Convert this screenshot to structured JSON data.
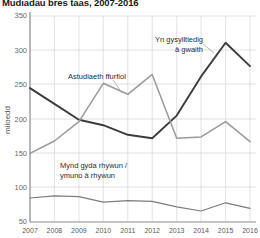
{
  "chart_data": {
    "type": "line",
    "title": "Mudiadau bres taas, 2007-2016",
    "xlabel": "",
    "ylabel": "miloedd",
    "x": [
      2007,
      2008,
      2009,
      2010,
      2011,
      2012,
      2013,
      2014,
      2015,
      2016
    ],
    "xtick_labels": [
      "2007",
      "2008",
      "2009",
      "2010",
      "2011",
      "2012",
      "2013",
      "2014",
      "2015",
      "2016"
    ],
    "ytick_labels": [
      "50",
      "100",
      "150",
      "200",
      "250",
      "300",
      "350"
    ],
    "yticks": [
      50,
      100,
      150,
      200,
      250,
      300,
      350
    ],
    "ylim": [
      50,
      350
    ],
    "xlim": [
      2007,
      2016
    ],
    "grid": true,
    "legend_position": "inline-annotations",
    "series": [
      {
        "name": "Yn gysylltiedig â gwaith",
        "color": "#3c3c3c",
        "width": 1.9,
        "values": [
          245,
          222,
          199,
          191,
          177,
          172,
          205,
          262,
          311,
          277
        ]
      },
      {
        "name": "Astudiaeth ffurfiol",
        "color": "#9a9a9a",
        "width": 1.5,
        "values": [
          150,
          168,
          196,
          252,
          236,
          265,
          172,
          174,
          196,
          167
        ]
      },
      {
        "name": "Mynd gyda rhywun / ymuno â rhywun",
        "color": "#7d7d7d",
        "width": 1.2,
        "values": [
          85,
          88,
          87,
          79,
          81,
          80,
          72,
          66,
          78,
          70
        ]
      }
    ],
    "annotations": [
      {
        "id": "annot-work",
        "text_line1": "Yn gysylltiedig",
        "text_line2": "â gwaith",
        "x": 147,
        "y": 41
      },
      {
        "id": "annot-study",
        "text_line1": "Astudiaeth ffurfiol",
        "text_line2": "",
        "x": 68,
        "y": 76
      },
      {
        "id": "annot-accompany",
        "text_line1": "Mynd gyda rhywun /",
        "text_line2": "ymuno â rhywun",
        "x": 60,
        "y": 165
      }
    ]
  }
}
